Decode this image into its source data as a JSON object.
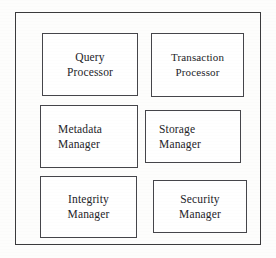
{
  "diagram": {
    "frame": {
      "label": "outer-container"
    },
    "boxes": [
      {
        "id": "query-processor",
        "line1": "Query",
        "line2": "Processor"
      },
      {
        "id": "transaction-processor",
        "line1": "Transaction",
        "line2": "Processor"
      },
      {
        "id": "metadata-manager",
        "line1": "Metadata",
        "line2": "Manager"
      },
      {
        "id": "storage-manager",
        "line1": "Storage",
        "line2": "Manager"
      },
      {
        "id": "integrity-manager",
        "line1": "Integrity",
        "line2": "Manager"
      },
      {
        "id": "security-manager",
        "line1": "Security",
        "line2": "Manager"
      }
    ]
  },
  "colors": {
    "background": "#fdfdfc",
    "box_fill": "#ffffff",
    "box_stroke": "#45454a",
    "frame_stroke": "#3a3a3c",
    "text": "#242428"
  }
}
